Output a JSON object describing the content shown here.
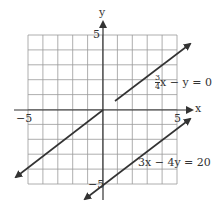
{
  "chart_data": {
    "type": "line",
    "title": "",
    "xlabel": "x",
    "ylabel": "y",
    "xlim": [
      -5,
      5
    ],
    "ylim": [
      -5,
      5
    ],
    "grid": true,
    "x_ticks_labeled": [
      "-5",
      "5"
    ],
    "y_ticks_labeled": [
      "5",
      "-5"
    ],
    "series": [
      {
        "name": "3/4x - y = 0",
        "equation": "y = 0.75x",
        "points": [
          [
            -5.9,
            -4.4
          ],
          [
            5.9,
            4.4
          ]
        ]
      },
      {
        "name": "3x - 4y = 20",
        "equation": "y = 0.75x - 5",
        "points": [
          [
            -1.0,
            -5.8
          ],
          [
            5.9,
            -0.6
          ]
        ]
      }
    ],
    "annotations": [
      {
        "text": "3/4x - y = 0",
        "anchor": [
          4.0,
          2.3
        ]
      },
      {
        "text": "3x - 4y = 20",
        "anchor": [
          3.4,
          -3.5
        ]
      }
    ]
  },
  "labels": {
    "x_axis": "x",
    "y_axis": "y",
    "x_min": "−5",
    "x_max": "5",
    "y_max": "5",
    "y_min": "−5",
    "eq1_num": "3",
    "eq1_den": "4",
    "eq1_rest": "x − y = 0",
    "eq2": "3x − 4y = 20"
  }
}
